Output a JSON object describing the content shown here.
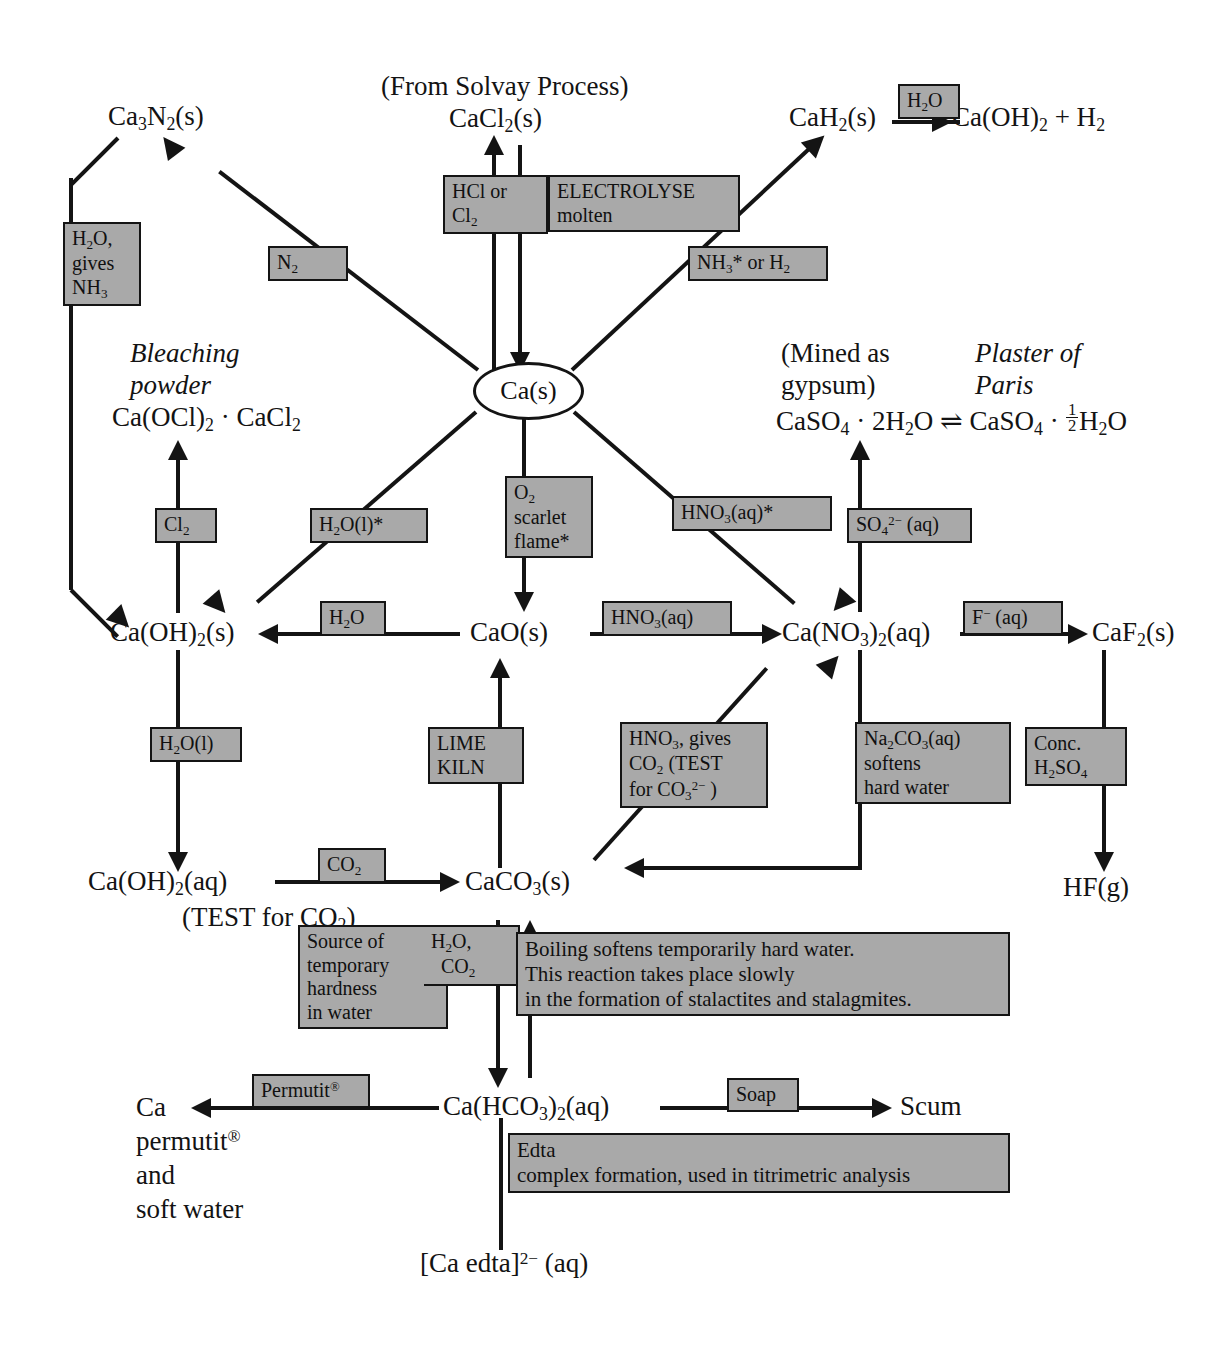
{
  "diagram": {
    "accent_box_fill": "#a9a9a9",
    "line_color": "#141414"
  },
  "species": {
    "ca3n2": "Ca<sub>3</sub>N<sub>2</sub>(s)",
    "solvay_note": "(From Solvay Process)",
    "cacl2": "CaCl<sub>2</sub>(s)",
    "cah2": "CaH<sub>2</sub>(s)",
    "ca_oh2_plus_h2": "Ca(OH)<sub>2</sub> + H<sub>2</sub>",
    "bleaching_powder_line1": "Bleaching",
    "bleaching_powder_line2": "powder",
    "bleaching_powder_formula": "Ca(OCl)<sub>2</sub> &middot; CaCl<sub>2</sub>",
    "mined_as_line1": "(Mined as",
    "mined_as_line2": "gypsum)",
    "plaster_line1": "Plaster of",
    "plaster_line2": "Paris",
    "gypsum_equilibrium": "CaSO<sub>4</sub> &middot; 2H<sub>2</sub>O &#8652; CaSO<sub>4</sub> &middot; <span class=\"frac\"><span class=\"num\">1</span><span class=\"den\">2</span></span>H<sub>2</sub>O",
    "ca_metal": "Ca(s)",
    "ca_oh2_s": "Ca(OH)<sub>2</sub>(s)",
    "cao": "CaO(s)",
    "ca_no3_2": "Ca(NO<sub>3</sub>)<sub>2</sub>(aq)",
    "caf2": "CaF<sub>2</sub>(s)",
    "hf": "HF(g)",
    "ca_oh2_aq": "Ca(OH)<sub>2</sub>(aq)",
    "test_for_co2": "(TEST for CO<sub>2</sub>)",
    "caco3": "CaCO<sub>3</sub>(s)",
    "ca_permutit_line1": "Ca",
    "ca_permutit_line2": "permutit<sup>&reg;</sup>",
    "ca_permutit_line3": "and",
    "ca_permutit_line4": "soft water",
    "ca_hco3_2": "Ca(HCO<sub>3</sub>)<sub>2</sub>(aq)",
    "scum": "Scum",
    "ca_edta": "[Ca edta]<sup>2&minus;</sup> (aq)"
  },
  "labels": {
    "h2o_gives_nh3": "H<sub>2</sub>O,<br>gives<br>NH<sub>3</sub>",
    "hcl_or_cl2": "HCl or<br>Cl<sub>2</sub>",
    "electrolyse_molten": "ELECTROLYSE<br>molten",
    "n2": "N<sub>2</sub>",
    "nh3_or_h2": "NH<sub>3</sub>* or H<sub>2</sub>",
    "h2o_top_right": "H<sub>2</sub>O",
    "cl2": "Cl<sub>2</sub>",
    "h2o_l_star": "H<sub>2</sub>O(l)*",
    "o2_scarlet_flame": "O<sub>2</sub><br>scarlet<br>flame*",
    "hno3_aq_star": "HNO<sub>3</sub>(aq)*",
    "so4_2minus_aq": "SO<sub>4</sub><sup>2&minus;</sup> (aq)",
    "h2o_left": "H<sub>2</sub>O",
    "hno3_aq": "HNO<sub>3</sub>(aq)",
    "f_minus_aq": "F<sup>&minus;</sup> (aq)",
    "h2o_l": "H<sub>2</sub>O(l)",
    "lime_kiln": "LIME<br>KILN",
    "hno3_gives_co2": "HNO<sub>3</sub>, gives<br>CO<sub>2</sub> (TEST<br>for CO<sub>3</sub><sup>2&minus;</sup> )",
    "na2co3_softens": "Na<sub>2</sub>CO<sub>3</sub>(aq)<br>softens<br>hard water",
    "conc_h2so4": "Conc.<br>H<sub>2</sub>SO<sub>4</sub>",
    "co2": "CO<sub>2</sub>",
    "source_of_hardness": "Source of<br>temporary<br>hardness<br>in water",
    "h2o_co2": "H<sub>2</sub>O,<br>&nbsp;&nbsp;CO<sub>2</sub>",
    "boiling_softens": "Boiling softens temporarily hard water.<br>This reaction takes place slowly<br>in the formation of stalactites and stalagmites.",
    "permutit": "Permutit<sup>&reg;</sup>",
    "soap": "Soap",
    "edta": "Edta<br>complex formation, used in titrimetric analysis"
  }
}
